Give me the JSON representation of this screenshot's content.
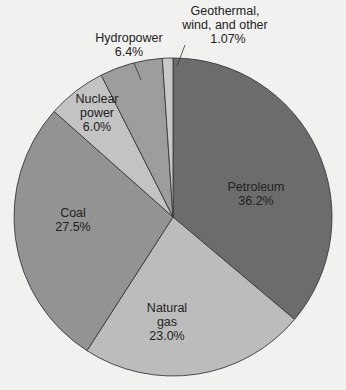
{
  "chart_data": {
    "type": "pie",
    "title": "",
    "start_angle_deg": 0,
    "direction": "clockwise",
    "slices": [
      {
        "name": "Petroleum",
        "label_lines": [
          "Petroleum"
        ],
        "value": 36.2,
        "value_label": "36.2%",
        "color": "#6c6c6c"
      },
      {
        "name": "Natural gas",
        "label_lines": [
          "Natural",
          "gas"
        ],
        "value": 23.0,
        "value_label": "23.0%",
        "color": "#bcbcbc"
      },
      {
        "name": "Coal",
        "label_lines": [
          "Coal"
        ],
        "value": 27.5,
        "value_label": "27.5%",
        "color": "#939393"
      },
      {
        "name": "Nuclear power",
        "label_lines": [
          "Nuclear",
          "power"
        ],
        "value": 6.0,
        "value_label": "6.0%",
        "color": "#c3c3c3"
      },
      {
        "name": "Hydropower",
        "label_lines": [
          "Hydropower"
        ],
        "value": 6.4,
        "value_label": "6.4%",
        "color": "#9d9d9d"
      },
      {
        "name": "Geothermal, wind, and other",
        "label_lines": [
          "Geothermal,",
          "wind, and other"
        ],
        "value": 1.07,
        "value_label": "1.07%",
        "color": "#c9c9c9"
      }
    ],
    "legend": "none"
  },
  "labels": {
    "petroleum": {
      "line1": "Petroleum",
      "value": "36.2%"
    },
    "natural_gas": {
      "line1": "Natural",
      "line2": "gas",
      "value": "23.0%"
    },
    "coal": {
      "line1": "Coal",
      "value": "27.5%"
    },
    "nuclear": {
      "line1": "Nuclear",
      "line2": "power",
      "value": "6.0%"
    },
    "hydro": {
      "line1": "Hydropower",
      "value": "6.4%"
    },
    "geothermal": {
      "line1": "Geothermal,",
      "line2": "wind, and other",
      "value": "1.07%"
    }
  }
}
